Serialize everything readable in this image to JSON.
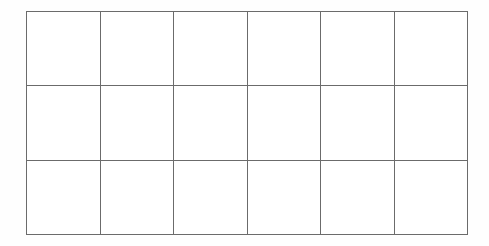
{
  "figure": {
    "type": "grid-table",
    "title": "",
    "rows": 3,
    "columns": 6,
    "line_color": "#6b6b6b",
    "background_color": "#ffffff",
    "canvas_width": 489,
    "canvas_height": 246,
    "grid_left": 26,
    "grid_top": 11,
    "grid_width": 442,
    "grid_height": 224
  },
  "table": {
    "headers": [
      "",
      "",
      "",
      "",
      "",
      ""
    ],
    "rows": [
      [
        "",
        "",
        "",
        "",
        "",
        ""
      ],
      [
        "",
        "",
        "",
        "",
        "",
        ""
      ],
      [
        "",
        "",
        "",
        "",
        "",
        ""
      ]
    ]
  }
}
